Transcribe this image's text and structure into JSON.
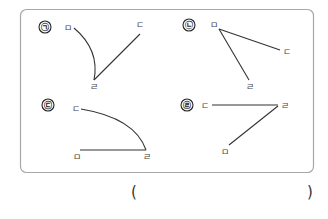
{
  "question": {
    "answer_blank": {
      "open": "(",
      "close": ")"
    }
  },
  "figures": [
    {
      "marker": "㉠",
      "labels": {
        "start": "ㅁ",
        "vertex": "ㄹ",
        "end": "ㄷ"
      },
      "description": "curved side from ㅁ to ㄹ, straight side from ㄹ to ㄷ"
    },
    {
      "marker": "㉡",
      "labels": {
        "vertex": "ㅁ",
        "end1": "ㄷ",
        "end2": "ㄹ"
      },
      "description": "two straight sides meeting at ㅁ"
    },
    {
      "marker": "㉢",
      "labels": {
        "start": "ㄷ",
        "vertex": "ㄹ",
        "end": "ㅁ"
      },
      "description": "curved side from ㄷ to ㄹ, straight side from ㄹ to ㅁ"
    },
    {
      "marker": "㉣",
      "labels": {
        "start": "ㄷ",
        "vertex": "ㄹ",
        "end": "ㅁ"
      },
      "description": "two straight sides meeting at ㄹ"
    }
  ]
}
